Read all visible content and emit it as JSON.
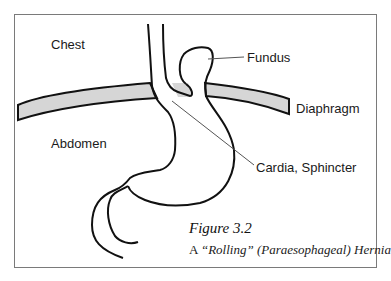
{
  "labels": {
    "chest": "Chest",
    "abdomen": "Abdomen",
    "fundus": "Fundus",
    "diaphragm": "Diaphragm",
    "cardia": "Cardia, Sphincter"
  },
  "caption": {
    "title": "Figure 3.2",
    "sub_prefix": "A ",
    "sub_quoted": "“Rolling”",
    "sub_paren": "(Paraesophageal)",
    "sub_suffix": "Hernia"
  },
  "colors": {
    "diaphragm_fill": "#d6d6d6",
    "stroke": "#111111",
    "frame": "#7a7a7a",
    "leader": "#555555"
  }
}
